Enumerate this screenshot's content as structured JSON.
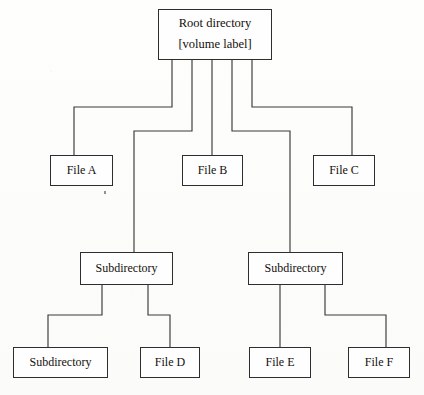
{
  "diagram": {
    "background_color": "#fdfdfc",
    "line_color": "#3a3a3a",
    "text_color": "#14100c",
    "nodes": {
      "root": {
        "line1": "Root directory",
        "line2": "[volume label]",
        "x": 158,
        "y": 9,
        "w": 114,
        "h": 51
      },
      "file_a": {
        "label": "File A",
        "x": 50,
        "y": 155,
        "w": 63,
        "h": 31
      },
      "file_b": {
        "label": "File B",
        "x": 182,
        "y": 155,
        "w": 61,
        "h": 31
      },
      "file_c": {
        "label": "File C",
        "x": 313,
        "y": 155,
        "w": 62,
        "h": 31
      },
      "subdir_left": {
        "label": "Subdirectory",
        "x": 80,
        "y": 252,
        "w": 93,
        "h": 33
      },
      "subdir_right": {
        "label": "Subdirectory",
        "x": 248,
        "y": 252,
        "w": 95,
        "h": 33
      },
      "subdir_bottom": {
        "label": "Subdirectory",
        "x": 13,
        "y": 347,
        "w": 95,
        "h": 31
      },
      "file_d": {
        "label": "File D",
        "x": 140,
        "y": 347,
        "w": 60,
        "h": 31
      },
      "file_e": {
        "label": "File E",
        "x": 249,
        "y": 347,
        "w": 62,
        "h": 31
      },
      "file_f": {
        "label": "File F",
        "x": 348,
        "y": 347,
        "w": 62,
        "h": 31
      }
    },
    "edges": [
      {
        "name": "root-to-file-a",
        "from": "root",
        "to": "file_a",
        "path": "M 172 60 L 172 107 L 74 107 L 74 155"
      },
      {
        "name": "root-to-subdir-left",
        "from": "root",
        "to": "subdir_left",
        "path": "M 192 60 L 192 131 L 134 131 L 134 252"
      },
      {
        "name": "root-to-file-b",
        "from": "root",
        "to": "file_b",
        "path": "M 212 60 L 212 155"
      },
      {
        "name": "root-to-subdir-right",
        "from": "root",
        "to": "subdir_right",
        "path": "M 232 60 L 232 131 L 290 131 L 290 252"
      },
      {
        "name": "root-to-file-c",
        "from": "root",
        "to": "file_c",
        "path": "M 252 60 L 252 107 L 352 107 L 352 155"
      },
      {
        "name": "subdir-left-to-subdir-bottom",
        "from": "subdir_left",
        "to": "subdir_bottom",
        "path": "M 102 285 L 102 315 L 48 315 L 48 347"
      },
      {
        "name": "subdir-left-to-file-d",
        "from": "subdir_left",
        "to": "file_d",
        "path": "M 148 285 L 148 315 L 170 315 L 170 347"
      },
      {
        "name": "subdir-right-to-file-e",
        "from": "subdir_right",
        "to": "file_e",
        "path": "M 280 285 L 280 347"
      },
      {
        "name": "subdir-right-to-file-f",
        "from": "subdir_right",
        "to": "file_f",
        "path": "M 325 285 L 325 315 L 386 315 L 386 347"
      }
    ],
    "artifacts": [
      {
        "name": "scan-speck",
        "x": 104,
        "y": 191
      }
    ]
  }
}
